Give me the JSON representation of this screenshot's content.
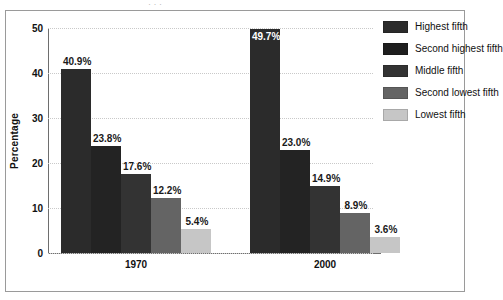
{
  "chart_data": {
    "type": "bar",
    "title": "",
    "xlabel": "",
    "ylabel": "Percentage",
    "ylim": [
      0,
      50
    ],
    "yticks": [
      0,
      10,
      20,
      30,
      40,
      50
    ],
    "grid": true,
    "grid_style": "dotted-horizontal",
    "legend_position": "right",
    "categories": [
      "1970",
      "2000"
    ],
    "series": [
      {
        "name": "Highest fifth",
        "color": "#2b2b2b",
        "values": [
          40.9,
          49.7
        ],
        "labels": [
          "40.9%",
          "49.7%"
        ],
        "label_inside": [
          false,
          true
        ]
      },
      {
        "name": "Second highest fifth",
        "color": "#232323",
        "values": [
          23.8,
          23.0
        ],
        "labels": [
          "23.8%",
          "23.0%"
        ],
        "label_inside": [
          false,
          false
        ]
      },
      {
        "name": "Middle fifth",
        "color": "#333333",
        "values": [
          17.6,
          14.9
        ],
        "labels": [
          "17.6%",
          "14.9%"
        ],
        "label_inside": [
          false,
          false
        ]
      },
      {
        "name": "Second lowest fifth",
        "color": "#646464",
        "values": [
          12.2,
          8.9
        ],
        "labels": [
          "12.2%",
          "8.9%"
        ],
        "label_inside": [
          false,
          false
        ]
      },
      {
        "name": "Lowest fifth",
        "color": "#c6c6c6",
        "values": [
          5.4,
          3.6
        ],
        "labels": [
          "5.4%",
          "3.6%"
        ],
        "label_inside": [
          false,
          false
        ]
      }
    ]
  },
  "axis": {
    "y_title": "Percentage",
    "y_ticks": [
      "0",
      "10",
      "20",
      "30",
      "40",
      "50"
    ],
    "x_ticks": [
      "1970",
      "2000"
    ]
  },
  "legend": {
    "items": [
      {
        "label": "Highest fifth",
        "color": "#2b2b2b"
      },
      {
        "label": "Second highest fifth",
        "color": "#1e1e1e"
      },
      {
        "label": "Middle fifth",
        "color": "#333333"
      },
      {
        "label": "Second lowest fifth",
        "color": "#646464"
      },
      {
        "label": "Lowest fifth",
        "color": "#c6c6c6"
      }
    ]
  },
  "artifact": {
    "cropped_top_text": "· ·  ·"
  }
}
